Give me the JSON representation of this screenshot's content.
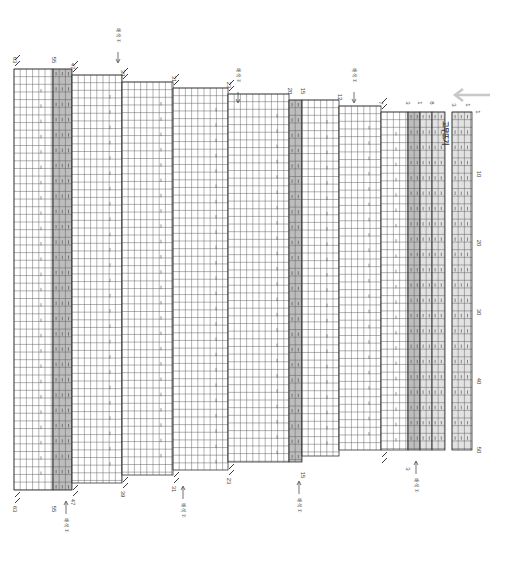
{
  "chart_title": "Knitting chart (rotated 90°)",
  "direction_arrow": {
    "icon": "arrow-left-icon",
    "color": "#c8c8c8"
  },
  "grid": {
    "cell_w": 6.2,
    "cell_h": 7.65,
    "color_line": "#555555",
    "shade_light": "#e2e2e2",
    "shade_dark": "#bdbdbd"
  },
  "row_axis": {
    "labels": [
      "1",
      "10",
      "20",
      "30",
      "40",
      "50"
    ],
    "rows": 50
  },
  "sections": [
    {
      "top_label": "63",
      "bottom_label": "63",
      "x0": 14,
      "x1": 53,
      "top": 69,
      "bottom": 490,
      "decrease_top": true,
      "decrease_bottom": true
    },
    {
      "top_label": "55",
      "bottom_label": "55",
      "x0": 53,
      "x1": 72,
      "top": 69,
      "bottom": 490,
      "shaded": "dark"
    },
    {
      "top_label": "47",
      "bottom_label": "47",
      "x0": 72,
      "x1": 122,
      "top": 75,
      "bottom": 483,
      "decrease_top": true,
      "decrease_bottom": true
    },
    {
      "top_label": "39",
      "bottom_label": "39",
      "x0": 122,
      "x1": 173,
      "top": 82,
      "bottom": 475,
      "decrease_top": true,
      "decrease_bottom": true
    },
    {
      "top_label": "31",
      "bottom_label": "31",
      "x0": 173,
      "x1": 228,
      "top": 88,
      "bottom": 470,
      "decrease_top": true,
      "decrease_bottom": true
    },
    {
      "top_label": "23",
      "bottom_label": "23",
      "x0": 228,
      "x1": 289,
      "top": 94,
      "bottom": 462,
      "decrease_top": true,
      "decrease_bottom": true
    },
    {
      "top_label": "20",
      "x0": 289,
      "x1": 302,
      "top": 100,
      "bottom": 462,
      "shaded": "dark"
    },
    {
      "top_label": "15",
      "bottom_label": "15",
      "x0": 302,
      "x1": 339,
      "top": 100,
      "bottom": 456
    },
    {
      "top_label": "12",
      "x0": 339,
      "x1": 381,
      "top": 106,
      "bottom": 450
    },
    {
      "top_label": "7",
      "x0": 381,
      "x1": 408,
      "top": 112,
      "bottom": 450,
      "decrease_top": true,
      "decrease_bottom": true
    },
    {
      "top_label": "3",
      "bottom_label": "3",
      "x0": 408,
      "x1": 420,
      "top": 112,
      "bottom": 450,
      "shaded": "dark"
    },
    {
      "top_label": "1",
      "x0": 420,
      "x1": 432,
      "top": 112,
      "bottom": 450,
      "shaded": "light"
    },
    {
      "top_label": "8",
      "x0": 432,
      "x1": 445,
      "top": 112,
      "bottom": 450,
      "shaded": "light"
    }
  ],
  "repeat_block": {
    "label": "3",
    "label2": "1",
    "x0": 452,
    "x1": 472,
    "top": 112,
    "bottom": 450,
    "vertical_text": "고무뜨기"
  },
  "annotations": {
    "top": [
      {
        "text": "배색①",
        "x": 118,
        "y": 40
      },
      {
        "text": "배색②",
        "x": 238,
        "y": 80
      },
      {
        "text": "배색①",
        "x": 354,
        "y": 80
      }
    ],
    "bottom": [
      {
        "text": "배색①",
        "x": 66,
        "y": 510
      },
      {
        "text": "배색②",
        "x": 183,
        "y": 495
      },
      {
        "text": "배색①",
        "x": 299,
        "y": 490
      },
      {
        "text": "배색①",
        "x": 416,
        "y": 470
      }
    ]
  }
}
